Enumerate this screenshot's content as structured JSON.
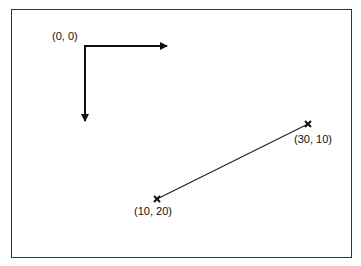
{
  "diagram": {
    "title": "",
    "origin_label": "(0, 0)",
    "points": [
      {
        "label": "(10, 20)",
        "x": 10,
        "y": 20
      },
      {
        "label": "(30, 10)",
        "x": 30,
        "y": 10
      }
    ],
    "colors": {
      "stroke": "#111111",
      "frame": "#333333",
      "background": "#ffffff"
    }
  }
}
